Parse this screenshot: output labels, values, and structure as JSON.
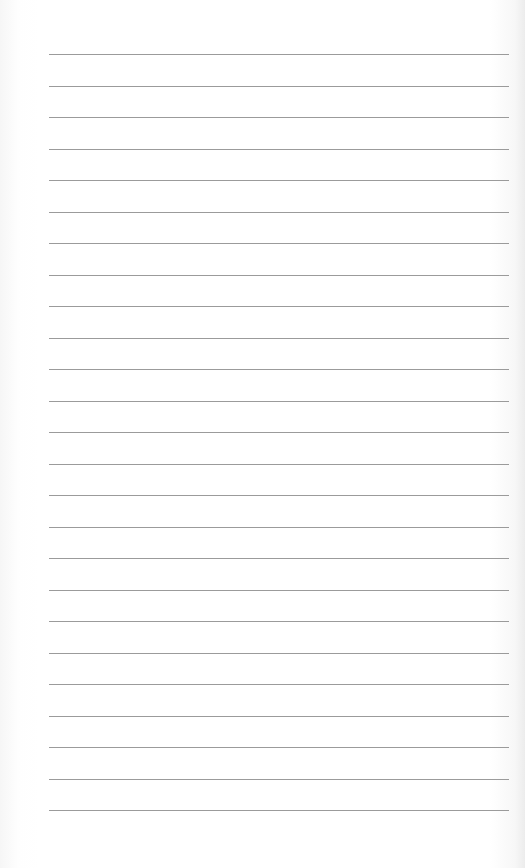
{
  "document": {
    "type": "lined-paper",
    "background_color": "#ffffff",
    "rule_color": "#8a8a8a",
    "rule_count": 25,
    "rule_left_px": 49,
    "rule_right_px": 509,
    "first_rule_y_px": 54,
    "rule_spacing_px": 31.5
  }
}
